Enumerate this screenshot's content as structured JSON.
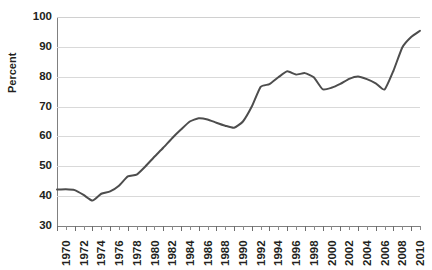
{
  "chart_data": {
    "type": "line",
    "title": "",
    "xlabel": "",
    "ylabel": "Percent",
    "ylim": [
      30,
      100
    ],
    "xlim": [
      1970,
      2011
    ],
    "y_ticks": [
      30,
      40,
      50,
      60,
      70,
      80,
      90,
      100
    ],
    "x_tick_labels": [
      "1970",
      "1972",
      "1974",
      "1976",
      "1978",
      "1980",
      "1982",
      "1984",
      "1986",
      "1988",
      "1990",
      "1992",
      "1994",
      "1996",
      "1998",
      "2000",
      "2002",
      "2004",
      "2006",
      "2008",
      "2010"
    ],
    "x_tick_step": 2,
    "x_minor_tick_step": 1,
    "grid": true,
    "grid_axis": "y",
    "legend": null,
    "line_color": "#4d4d4d",
    "line_width": 2,
    "x": [
      1970,
      1971,
      1972,
      1973,
      1974,
      1975,
      1976,
      1977,
      1978,
      1979,
      1980,
      1981,
      1982,
      1983,
      1984,
      1985,
      1986,
      1987,
      1988,
      1989,
      1990,
      1991,
      1992,
      1993,
      1994,
      1995,
      1996,
      1997,
      1998,
      1999,
      2000,
      2001,
      2002,
      2003,
      2004,
      2005,
      2006,
      2007,
      2008,
      2009,
      2010,
      2011
    ],
    "values": [
      42.2,
      42.3,
      42.0,
      40.4,
      38.5,
      40.8,
      41.6,
      43.5,
      46.6,
      47.2,
      50.0,
      53.2,
      56.2,
      59.4,
      62.3,
      65.0,
      66.1,
      65.7,
      64.6,
      63.6,
      62.9,
      65.0,
      70.0,
      76.6,
      77.5,
      79.8,
      81.8,
      80.7,
      81.2,
      79.8,
      75.8,
      76.3,
      77.6,
      79.3,
      80.1,
      79.2,
      77.8,
      75.7,
      82.0,
      89.8,
      93.3,
      95.4
    ]
  }
}
